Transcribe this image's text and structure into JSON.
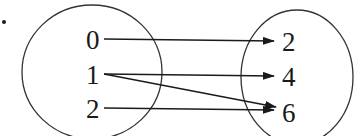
{
  "diagram": {
    "type": "mapping",
    "domain_set": {
      "elements": [
        "0",
        "1",
        "2"
      ]
    },
    "codomain_set": {
      "elements": [
        "2",
        "4",
        "6"
      ]
    },
    "mappings": [
      {
        "from": "0",
        "to": "2"
      },
      {
        "from": "1",
        "to": "4"
      },
      {
        "from": "1",
        "to": "6"
      },
      {
        "from": "2",
        "to": "6"
      }
    ],
    "colors": {
      "stroke": "#1a1a1a",
      "background": "#ffffff"
    }
  }
}
